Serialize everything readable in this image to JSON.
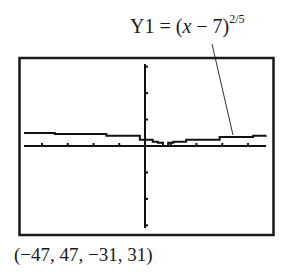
{
  "chart_data": {
    "type": "line",
    "function": {
      "name": "Y1",
      "expression_prefix": "Y1 = (",
      "variable": "x",
      "expression_mid": " − 7)",
      "exponent": "2/5"
    },
    "window": {
      "xmin": -47,
      "xmax": 47,
      "ymin": -31,
      "ymax": 31,
      "xscl": 10,
      "yscl": 10
    },
    "window_label": "(−47, 47, −31, 31)",
    "x_ticks": [
      -40,
      -30,
      -20,
      -10,
      10,
      20,
      30,
      40
    ],
    "y_ticks": [
      -30,
      -20,
      -10,
      10,
      20,
      30
    ],
    "grid": false,
    "series": [
      {
        "name": "Y1",
        "x": [
          -47,
          -35,
          -15,
          -2,
          3,
          5,
          7,
          9,
          11,
          16,
          29,
          42,
          47
        ],
        "values": [
          4.9,
          4.5,
          3.9,
          2.4,
          1.6,
          1.2,
          0,
          1.2,
          1.6,
          2.4,
          3.4,
          3.9,
          4.0
        ]
      }
    ],
    "annotation": {
      "text": "Y1 = (x − 7)^(2/5)",
      "points_to": "curve near x=29"
    }
  }
}
